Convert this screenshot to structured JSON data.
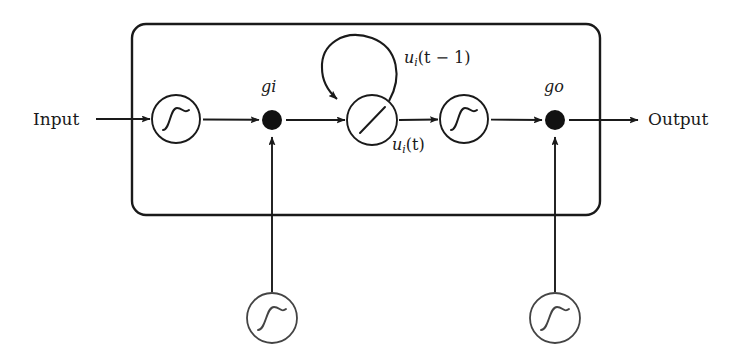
{
  "diagram": {
    "stroke_color": "#1a1a1a",
    "background_color": "#ffffff",
    "labels": {
      "input": "Input",
      "output": "Output",
      "input_gate": "gi",
      "output_gate": "go",
      "state_prev": "u",
      "state_prev_sub": "i",
      "state_prev_arg": "(t − 1)",
      "state_now": "u",
      "state_now_sub": "i",
      "state_now_arg": "(t)"
    },
    "nodes": [
      {
        "name": "input-squashing-unit",
        "type": "sigmoid-circle",
        "cx": 176,
        "cy": 119,
        "r": 24
      },
      {
        "name": "input-gate-multiplier",
        "type": "filled-dot",
        "cx": 272,
        "cy": 120,
        "r": 10
      },
      {
        "name": "cell-state-unit",
        "type": "linear-circle",
        "cx": 372,
        "cy": 120,
        "r": 25
      },
      {
        "name": "output-squashing-unit",
        "type": "sigmoid-circle",
        "cx": 464,
        "cy": 119,
        "r": 24
      },
      {
        "name": "output-gate-multiplier",
        "type": "filled-dot",
        "cx": 555,
        "cy": 120,
        "r": 10
      },
      {
        "name": "input-gate-unit",
        "type": "sigmoid-circle",
        "cx": 272,
        "cy": 318,
        "r": 25
      },
      {
        "name": "output-gate-unit",
        "type": "sigmoid-circle",
        "cx": 555,
        "cy": 318,
        "r": 25
      }
    ],
    "cell_box": {
      "x": 132,
      "y": 24,
      "width": 468,
      "height": 191,
      "radius": 14
    },
    "edges": [
      {
        "name": "input-to-squash",
        "from": "Input",
        "to": "input-squashing-unit"
      },
      {
        "name": "squash-to-input-gate",
        "from": "input-squashing-unit",
        "to": "input-gate-multiplier"
      },
      {
        "name": "input-gate-to-state",
        "from": "input-gate-multiplier",
        "to": "cell-state-unit"
      },
      {
        "name": "state-self-recurrence",
        "from": "cell-state-unit",
        "to": "cell-state-unit"
      },
      {
        "name": "state-to-output-squash",
        "from": "cell-state-unit",
        "to": "output-squashing-unit"
      },
      {
        "name": "output-squash-to-output-gate",
        "from": "output-squashing-unit",
        "to": "output-gate-multiplier"
      },
      {
        "name": "output-gate-to-output",
        "from": "output-gate-multiplier",
        "to": "Output"
      },
      {
        "name": "input-gate-unit-to-multiplier",
        "from": "input-gate-unit",
        "to": "input-gate-multiplier"
      },
      {
        "name": "output-gate-unit-to-multiplier",
        "from": "output-gate-unit",
        "to": "output-gate-multiplier"
      }
    ]
  }
}
